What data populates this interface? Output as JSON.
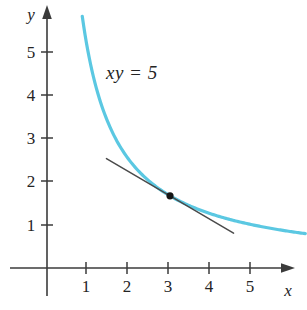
{
  "figure": {
    "background_color": "#ffffff"
  },
  "axes": {
    "x_axis_label": "x",
    "y_axis_label": "y",
    "x_tick_labels": [
      "1",
      "2",
      "3",
      "4",
      "5"
    ],
    "y_tick_labels": [
      "1",
      "2",
      "3",
      "4",
      "5"
    ],
    "axis_color": "#3b3b3b"
  },
  "annotations": {
    "curve_equation_label": "xy = 5"
  },
  "chart_data": {
    "type": "line",
    "title": "",
    "subtitle": "",
    "xlabel": "x",
    "ylabel": "y",
    "xlim": [
      0,
      6.35
    ],
    "ylim": [
      0,
      6.2
    ],
    "grid": false,
    "legend": null,
    "x_ticks": [
      1,
      2,
      3,
      4,
      5
    ],
    "y_ticks": [
      1,
      2,
      3,
      4,
      5
    ],
    "annotations": [
      {
        "text": "xy = 5",
        "x": 1.45,
        "y": 4.55,
        "style": "italic"
      }
    ],
    "series": [
      {
        "name": "xy = 5",
        "equation": "y = 5/x",
        "color": "#5bc8e2",
        "stroke_width": 3.2,
        "x_range": [
          0.86,
          6.3
        ],
        "points": [
          {
            "x": 0.86,
            "y": 5.81
          },
          {
            "x": 1.0,
            "y": 5.0
          },
          {
            "x": 1.25,
            "y": 4.0
          },
          {
            "x": 1.5,
            "y": 3.33
          },
          {
            "x": 1.75,
            "y": 2.86
          },
          {
            "x": 2.0,
            "y": 2.5
          },
          {
            "x": 2.5,
            "y": 2.0
          },
          {
            "x": 3.0,
            "y": 1.667
          },
          {
            "x": 3.5,
            "y": 1.429
          },
          {
            "x": 4.0,
            "y": 1.25
          },
          {
            "x": 4.5,
            "y": 1.111
          },
          {
            "x": 5.0,
            "y": 1.0
          },
          {
            "x": 5.5,
            "y": 0.909
          },
          {
            "x": 6.0,
            "y": 0.833
          },
          {
            "x": 6.3,
            "y": 0.794
          }
        ]
      },
      {
        "name": "tangent line at (3, 5/3)",
        "equation": "y = -5/9 x + 10/3",
        "color": "#4a4a4a",
        "stroke_width": 1.5,
        "x_range": [
          1.45,
          4.55
        ],
        "points": [
          {
            "x": 1.45,
            "y": 2.528
          },
          {
            "x": 4.55,
            "y": 0.806
          }
        ]
      }
    ],
    "marked_points": [
      {
        "label": "",
        "x": 3,
        "y": 1.667,
        "color": "#151515",
        "radius": 3.6
      }
    ]
  }
}
